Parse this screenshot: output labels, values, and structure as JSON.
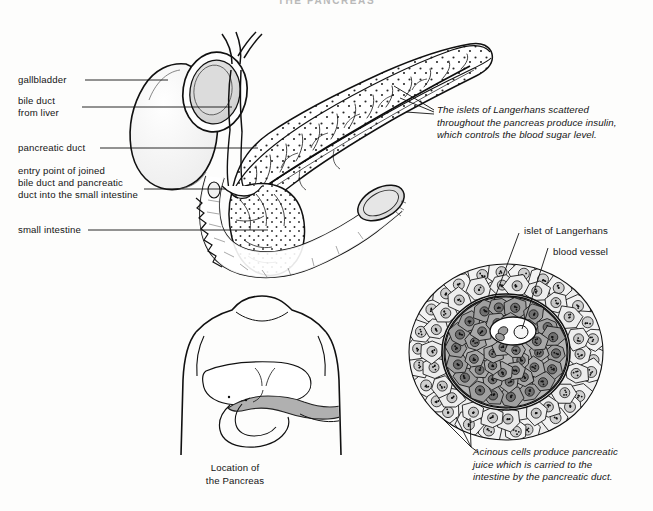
{
  "document": {
    "title": "THE PANCREAS",
    "background_color": "#fdfdfc",
    "ink_color": "#141414"
  },
  "labels": {
    "gallbladder": "gallbladder",
    "bile_duct": "bile duct\nfrom liver",
    "pancreatic_duct": "pancreatic duct",
    "entry_point": "entry point of joined\nbile duct and pancreatic\nduct into the small intestine",
    "small_intestine": "small intestine",
    "islet_of_langerhans": "islet of Langerhans",
    "blood_vessel": "blood vessel"
  },
  "captions": {
    "islets_note": "The islets of Langerhans scattered\nthroughout the pancreas produce insulin,\nwhich controls the blood sugar level.",
    "acinous_note": "Acinous cells produce pancreatic\njuice which is carried to the\nintestine by the pancreatic duct.",
    "location_caption": "Location of\nthe Pancreas"
  },
  "figures": {
    "main_organ": "pancreas-duodenum-gallbladder-illustration",
    "torso": "human-torso-pancreas-location",
    "islet": "islet-of-langerhans-micrograph"
  }
}
